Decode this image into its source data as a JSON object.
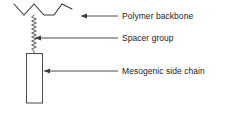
{
  "diagram": {
    "background_color": "#ffffff",
    "stroke_color": "#3a3a3a",
    "text_color": "#1a1a1a",
    "structure": {
      "backbone": {
        "icon": "zigzag-chain-icon",
        "description": "zigzag polymer backbone chain",
        "points": "14,4 24,15 34,4 44,15 54,15 62,4 72,9"
      },
      "spacer": {
        "icon": "coil-spring-icon",
        "description": "vertical coiled spacer group",
        "x": 34,
        "y_top": 15,
        "y_bottom": 53,
        "coil_count": 17
      },
      "mesogen": {
        "icon": "rectangle-block-icon",
        "description": "rectangular mesogenic side chain unit",
        "x": 26,
        "y": 53,
        "width": 16,
        "height": 50
      }
    },
    "callouts": [
      {
        "id": "polymer-backbone",
        "label": "Polymer backbone",
        "arrow": {
          "tail_x": 118,
          "tip_x": 81,
          "y": 16,
          "direction": "left"
        }
      },
      {
        "id": "spacer-group",
        "label": "Spacer group",
        "arrow": {
          "tail_x": 118,
          "tip_x": 35,
          "y": 38,
          "direction": "left"
        }
      },
      {
        "id": "mesogenic-side-chain",
        "label": "Mesogenic side chain",
        "arrow": {
          "tail_x": 118,
          "tip_x": 44,
          "y": 71,
          "direction": "left"
        }
      }
    ]
  }
}
